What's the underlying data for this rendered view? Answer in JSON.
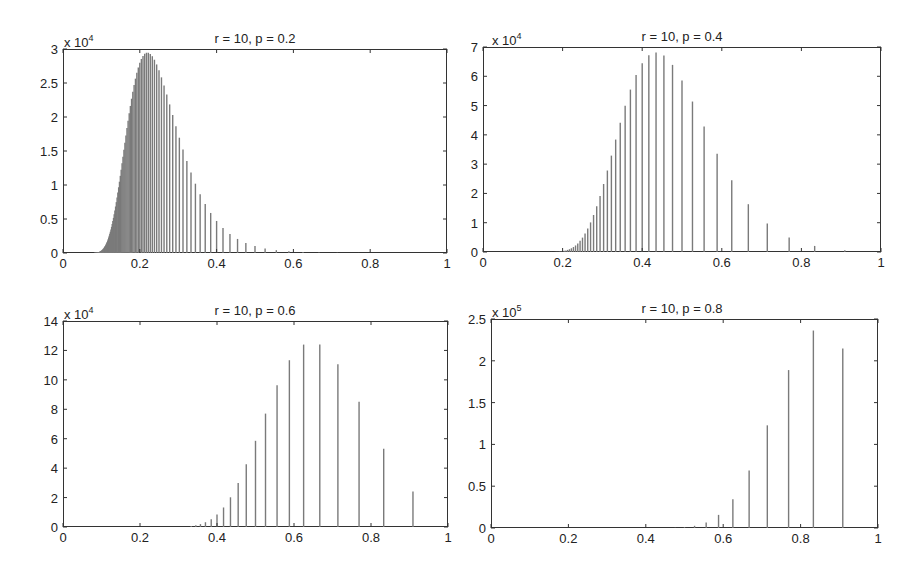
{
  "chart_data": [
    {
      "type": "bar",
      "subtype": "stem",
      "title": "r = 10, p = 0.2",
      "r": 10,
      "p": 0.2,
      "N": 1000000,
      "x_formula": "r/(r+k)",
      "xlabel": "",
      "ylabel": "",
      "xlim": [
        0,
        1
      ],
      "ylim": [
        0,
        30000
      ],
      "y_multiplier_label": "x 10",
      "y_multiplier_exp": "4",
      "xticks": [
        "0",
        "0.2",
        "0.4",
        "0.6",
        "0.8",
        "1"
      ],
      "yticks": [
        "0",
        "0.5",
        "1",
        "1.5",
        "2",
        "2.5",
        "3"
      ],
      "peak": {
        "x": 0.22,
        "y": 29500
      },
      "grid": false,
      "color": "#7a7a7a"
    },
    {
      "type": "bar",
      "subtype": "stem",
      "title": "r = 10, p = 0.4",
      "r": 10,
      "p": 0.4,
      "N": 1000000,
      "x_formula": "r/(r+k)",
      "xlabel": "",
      "ylabel": "",
      "xlim": [
        0,
        1
      ],
      "ylim": [
        0,
        70000
      ],
      "y_multiplier_label": "x 10",
      "y_multiplier_exp": "4",
      "xticks": [
        "0",
        "0.2",
        "0.4",
        "0.6",
        "0.8",
        "1"
      ],
      "yticks": [
        "0",
        "1",
        "2",
        "3",
        "4",
        "5",
        "6",
        "7"
      ],
      "peak": {
        "x": 0.435,
        "y": 68700
      },
      "grid": false,
      "color": "#7a7a7a"
    },
    {
      "type": "bar",
      "subtype": "stem",
      "title": "r = 10, p = 0.6",
      "r": 10,
      "p": 0.6,
      "N": 1000000,
      "x_formula": "r/(r+k)",
      "xlabel": "",
      "ylabel": "",
      "xlim": [
        0,
        1
      ],
      "ylim": [
        0,
        140000
      ],
      "y_multiplier_label": "x 10",
      "y_multiplier_exp": "4",
      "xticks": [
        "0",
        "0.2",
        "0.4",
        "0.6",
        "0.8",
        "1"
      ],
      "yticks": [
        "0",
        "2",
        "4",
        "6",
        "8",
        "10",
        "12",
        "14"
      ],
      "x": [
        0.909,
        0.833,
        0.769,
        0.714,
        0.667,
        0.625,
        0.588,
        0.556,
        0.526,
        0.5,
        0.476,
        0.455,
        0.435,
        0.417,
        0.4,
        0.385,
        0.37,
        0.357,
        0.345,
        0.333
      ],
      "values": [
        24190,
        53210,
        85140,
        110690,
        123970,
        123970,
        113340,
        96340,
        77070,
        58570,
        42600,
        29820,
        20190,
        13270,
        8490,
        5310,
        3250,
        1950,
        1150,
        670
      ],
      "grid": false,
      "color": "#7a7a7a"
    },
    {
      "type": "bar",
      "subtype": "stem",
      "title": "r = 10, p = 0.8",
      "r": 10,
      "p": 0.8,
      "N": 1000000,
      "x_formula": "r/(r+k)",
      "xlabel": "",
      "ylabel": "",
      "xlim": [
        0,
        1
      ],
      "ylim": [
        0,
        250000
      ],
      "y_multiplier_label": "x 10",
      "y_multiplier_exp": "5",
      "xticks": [
        "0",
        "0.2",
        "0.4",
        "0.6",
        "0.8",
        "1"
      ],
      "yticks": [
        "0",
        "0.5",
        "1",
        "1.5",
        "2",
        "2.5"
      ],
      "x": [
        0.909,
        0.833,
        0.769,
        0.714,
        0.667,
        0.625,
        0.588,
        0.556,
        0.526,
        0.5,
        0.476
      ],
      "values": [
        214700,
        236200,
        188900,
        122800,
        68800,
        34400,
        15700,
        6600,
        2600,
        1000,
        380
      ],
      "grid": false,
      "color": "#7a7a7a"
    }
  ]
}
